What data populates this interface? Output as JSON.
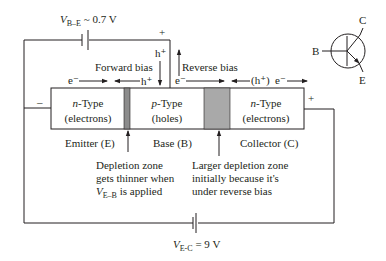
{
  "diagram": {
    "type": "npn-transistor-biasing",
    "colors": {
      "line": "#231f20",
      "depletion_emitter": "#8c8c8c",
      "depletion_collector": "#a9a9a9",
      "box_fill": "#ffffff"
    },
    "batteries": {
      "base_emitter": {
        "label_v": "V",
        "label_sub": "B–E",
        "label_value": " ~ 0.7 V",
        "plus": "+",
        "minus": "–"
      },
      "emitter_collector": {
        "label_v": "V",
        "label_sub": "E-C",
        "label_value": " = 9 V",
        "plus": "+"
      }
    },
    "bias_labels": {
      "forward": "Forward bias",
      "reverse": "Reverse bias"
    },
    "carriers": {
      "emitter_electron": "e⁻",
      "emitter_hole": "h⁺",
      "base_hole_top": "h⁺",
      "collector_electron_left": "e⁻",
      "collector_hole": "(h⁺)",
      "collector_electron_right": "e⁻"
    },
    "regions": [
      {
        "type_italic": "n",
        "type_rest": "-Type",
        "carrier": "(electrons)",
        "name": "Emitter (E)"
      },
      {
        "type_italic": "p",
        "type_rest": "-Type",
        "carrier": "(holes)",
        "name": "Base (B)"
      },
      {
        "type_italic": "n",
        "type_rest": "-Type",
        "carrier": "(electrons)",
        "name": "Collector (C)"
      }
    ],
    "annotations": {
      "emitter_depletion": {
        "line1": "Depletion zone",
        "line2": "gets thinner when",
        "line3_v": "V",
        "line3_sub": "E–B",
        "line3_rest": " is applied"
      },
      "collector_depletion": {
        "line1": "Larger depletion zone",
        "line2": "initially because it's",
        "line3": "under reverse bias"
      }
    },
    "symbol": {
      "base": "B",
      "collector": "C",
      "emitter": "E"
    }
  }
}
